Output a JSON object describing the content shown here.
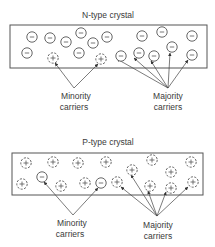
{
  "colors": {
    "line": "#555555",
    "text": "#3a3a3a",
    "background": "#ffffff"
  },
  "panels": [
    {
      "id": "n-type",
      "title": "N-type crystal",
      "title_pos": [
        108,
        18
      ],
      "frame": {
        "x": 10,
        "y": 25,
        "w": 197,
        "h": 43
      },
      "carriers": [
        {
          "x": 32,
          "y": 37,
          "sign": "-"
        },
        {
          "x": 50,
          "y": 38,
          "sign": "-"
        },
        {
          "x": 66,
          "y": 42,
          "sign": "-"
        },
        {
          "x": 81,
          "y": 33,
          "sign": "-"
        },
        {
          "x": 93,
          "y": 43,
          "sign": "-"
        },
        {
          "x": 107,
          "y": 37,
          "sign": "-"
        },
        {
          "x": 142,
          "y": 36,
          "sign": "-"
        },
        {
          "x": 162,
          "y": 32,
          "sign": "-"
        },
        {
          "x": 192,
          "y": 36,
          "sign": "-"
        },
        {
          "x": 27,
          "y": 53,
          "sign": "-"
        },
        {
          "x": 53,
          "y": 58,
          "sign": "+"
        },
        {
          "x": 79,
          "y": 53,
          "sign": "-"
        },
        {
          "x": 101,
          "y": 59,
          "sign": "+"
        },
        {
          "x": 121,
          "y": 56,
          "sign": "-"
        },
        {
          "x": 139,
          "y": 53,
          "sign": "-"
        },
        {
          "x": 154,
          "y": 56,
          "sign": "-"
        },
        {
          "x": 172,
          "y": 47,
          "sign": "-"
        },
        {
          "x": 192,
          "y": 55,
          "sign": "-"
        }
      ],
      "minority": {
        "label_line1": "Minority",
        "label_line2": "carriers",
        "label_pos": [
          76,
          99
        ],
        "origin": [
          74,
          88
        ],
        "targets": [
          [
            55,
            63
          ],
          [
            98,
            64
          ]
        ]
      },
      "majority": {
        "label_line1": "Majority",
        "label_line2": "carriers",
        "label_pos": [
          168,
          99
        ],
        "origin": [
          168,
          88
        ],
        "targets": [
          [
            117,
            59
          ],
          [
            134,
            58
          ],
          [
            151,
            61
          ],
          [
            170,
            53
          ],
          [
            188,
            60
          ]
        ]
      }
    },
    {
      "id": "p-type",
      "title": "P-type crystal",
      "title_pos": [
        108,
        145
      ],
      "frame": {
        "x": 12,
        "y": 153,
        "w": 191,
        "h": 42
      },
      "carriers": [
        {
          "x": 26,
          "y": 163,
          "sign": "+"
        },
        {
          "x": 53,
          "y": 162,
          "sign": "+"
        },
        {
          "x": 78,
          "y": 163,
          "sign": "+"
        },
        {
          "x": 106,
          "y": 162,
          "sign": "+"
        },
        {
          "x": 152,
          "y": 160,
          "sign": "+"
        },
        {
          "x": 191,
          "y": 162,
          "sign": "+"
        },
        {
          "x": 132,
          "y": 170,
          "sign": "+"
        },
        {
          "x": 171,
          "y": 172,
          "sign": "+"
        },
        {
          "x": 42,
          "y": 177,
          "sign": "-"
        },
        {
          "x": 22,
          "y": 184,
          "sign": "+"
        },
        {
          "x": 61,
          "y": 186,
          "sign": "+"
        },
        {
          "x": 85,
          "y": 183,
          "sign": "+"
        },
        {
          "x": 101,
          "y": 183,
          "sign": "-"
        },
        {
          "x": 117,
          "y": 182,
          "sign": "+"
        },
        {
          "x": 150,
          "y": 186,
          "sign": "+"
        },
        {
          "x": 171,
          "y": 188,
          "sign": "+"
        },
        {
          "x": 193,
          "y": 182,
          "sign": "+"
        }
      ],
      "minority": {
        "label_line1": "Minority",
        "label_line2": "carriers",
        "label_pos": [
          72,
          226
        ],
        "origin": [
          73,
          215
        ],
        "targets": [
          [
            44,
            182
          ],
          [
            98,
            188
          ]
        ]
      },
      "majority": {
        "label_line1": "Majority",
        "label_line2": "carriers",
        "label_pos": [
          158,
          228
        ],
        "origin": [
          157,
          216
        ],
        "targets": [
          [
            121,
            187
          ],
          [
            131,
            175
          ],
          [
            148,
            191
          ],
          [
            166,
            192
          ],
          [
            188,
            187
          ]
        ]
      }
    }
  ]
}
